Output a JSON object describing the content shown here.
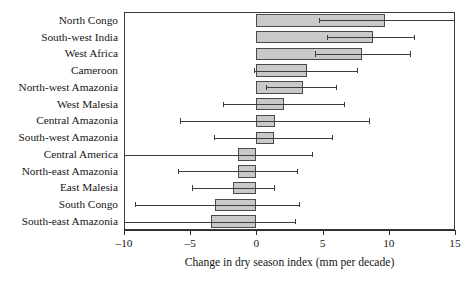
{
  "chart_data": {
    "type": "bar",
    "orientation": "horizontal",
    "title": "",
    "xlabel": "Change in dry season index (mm per decade)",
    "ylabel": "",
    "xlim": [
      -10,
      15
    ],
    "xticks": [
      -10,
      -5,
      0,
      5,
      10,
      15
    ],
    "xticklabels": [
      "–10",
      "–5",
      "0",
      "5",
      "10",
      "15"
    ],
    "grid": false,
    "legend": null,
    "bar_color": "#c9c9c9",
    "bar_edge_color": "#4a4a4a",
    "error_color": "#3c3c3c",
    "categories": [
      "North Congo",
      "South-west India",
      "West Africa",
      "Cameroon",
      "North-west Amazonia",
      "West Malesia",
      "Central Amazonia",
      "South-west Amazonia",
      "Central America",
      "North-east Amazonia",
      "East Malesia",
      "South Congo",
      "South-east Amazonia"
    ],
    "values": [
      9.7,
      8.8,
      8.0,
      3.8,
      3.5,
      2.1,
      1.4,
      1.3,
      -1.4,
      -1.4,
      -1.8,
      -3.1,
      -3.4
    ],
    "error_low": [
      4.7,
      5.3,
      4.4,
      -0.2,
      0.7,
      -2.5,
      -5.8,
      -3.2,
      -10.0,
      -5.9,
      -4.9,
      -9.2,
      -10.0
    ],
    "error_high": [
      15.0,
      11.9,
      11.6,
      7.6,
      6.0,
      6.6,
      8.5,
      5.7,
      4.2,
      3.1,
      1.3,
      3.2,
      2.9
    ]
  }
}
